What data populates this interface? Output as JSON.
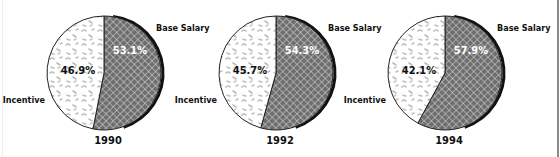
{
  "chart_data": [
    {
      "type": "pie",
      "title": "1990",
      "categories": [
        "Base Salary",
        "Incentive"
      ],
      "values": [
        53.1,
        46.9
      ],
      "labels": [
        "53.1%",
        "46.9%"
      ]
    },
    {
      "type": "pie",
      "title": "1992",
      "categories": [
        "Base Salary",
        "Incentive"
      ],
      "values": [
        54.3,
        45.7
      ],
      "labels": [
        "54.3%",
        "45.7%"
      ]
    },
    {
      "type": "pie",
      "title": "1994",
      "categories": [
        "Base Salary",
        "Incentive"
      ],
      "values": [
        57.9,
        42.1
      ],
      "labels": [
        "57.9%",
        "42.1%"
      ]
    }
  ],
  "legend": {
    "base_salary": "Base Salary",
    "incentive": "Incentive"
  },
  "colors": {
    "base_salary_fill": "#6e6e6e",
    "base_salary_hatch": "#d8d8d8",
    "incentive_fill": "#ffffff",
    "incentive_speckle": "#b8b8b8",
    "outline": "#111111"
  }
}
